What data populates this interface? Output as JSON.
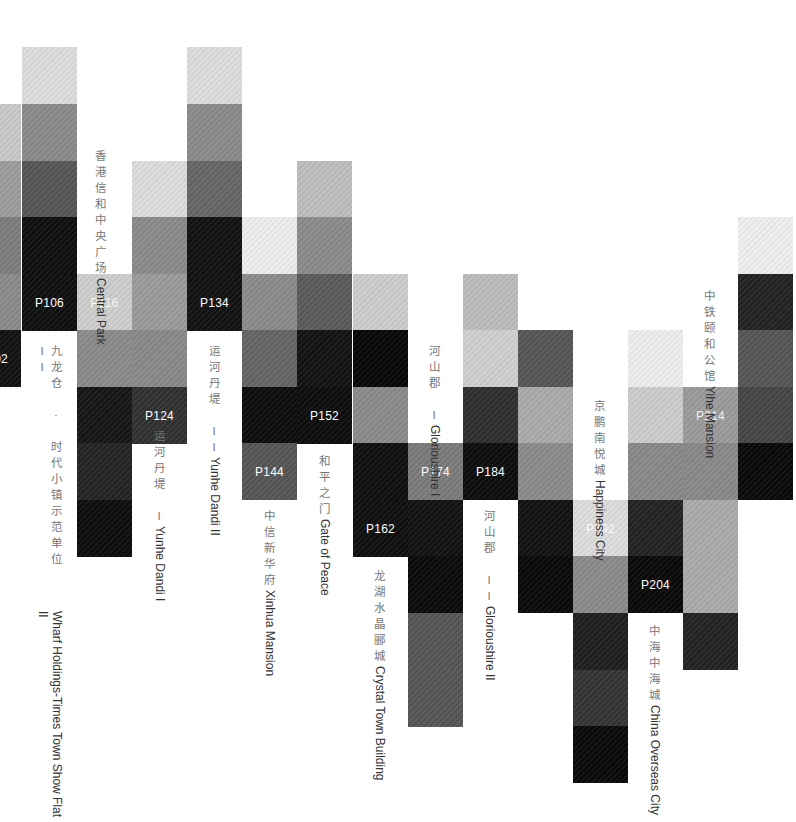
{
  "grid": {
    "col_x": [
      -34,
      22,
      77,
      132,
      187,
      242,
      297,
      353,
      408,
      463,
      518,
      573,
      628,
      683,
      738
    ],
    "row_y": [
      47,
      104,
      161,
      217,
      274,
      330,
      387,
      443,
      500,
      556,
      613,
      670,
      726
    ]
  },
  "cells": [
    {
      "c": 0,
      "r": 1,
      "color": "#c8c8c8"
    },
    {
      "c": 0,
      "r": 2,
      "color": "#9c9c9c"
    },
    {
      "c": 0,
      "r": 3,
      "color": "#7c7c7c"
    },
    {
      "c": 0,
      "r": 4,
      "color": "#8a8a8a"
    },
    {
      "c": 0,
      "r": 5,
      "color": "#111111",
      "page": "P102"
    },
    {
      "c": 1,
      "r": 0,
      "color": "#dcdcdc"
    },
    {
      "c": 1,
      "r": 1,
      "color": "#8a8a8a"
    },
    {
      "c": 1,
      "r": 2,
      "color": "#555555"
    },
    {
      "c": 1,
      "r": 3,
      "color": "#0e0e0e"
    },
    {
      "c": 1,
      "r": 4,
      "color": "#0e0e0e",
      "page": "P106"
    },
    {
      "c": 2,
      "r": 4,
      "color": "#cdcdcd",
      "page": "P116",
      "light": true
    },
    {
      "c": 2,
      "r": 5,
      "color": "#8a8a8a"
    },
    {
      "c": 2,
      "r": 6,
      "color": "#151515"
    },
    {
      "c": 2,
      "r": 7,
      "color": "#232323"
    },
    {
      "c": 2,
      "r": 8,
      "color": "#0c0c0c"
    },
    {
      "c": 3,
      "r": 2,
      "color": "#dcdcdc"
    },
    {
      "c": 3,
      "r": 3,
      "color": "#8a8a8a"
    },
    {
      "c": 3,
      "r": 4,
      "color": "#9a9a9a"
    },
    {
      "c": 3,
      "r": 5,
      "color": "#888888"
    },
    {
      "c": 3,
      "r": 6,
      "color": "#303030",
      "page": "P124"
    },
    {
      "c": 4,
      "r": 0,
      "color": "#dcdcdc"
    },
    {
      "c": 4,
      "r": 1,
      "color": "#8a8a8a"
    },
    {
      "c": 4,
      "r": 2,
      "color": "#666666"
    },
    {
      "c": 4,
      "r": 3,
      "color": "#111111"
    },
    {
      "c": 4,
      "r": 4,
      "color": "#111111",
      "page": "P134"
    },
    {
      "c": 5,
      "r": 3,
      "color": "#ececec"
    },
    {
      "c": 5,
      "r": 4,
      "color": "#8a8a8a"
    },
    {
      "c": 5,
      "r": 5,
      "color": "#646464"
    },
    {
      "c": 5,
      "r": 6,
      "color": "#0c0c0c"
    },
    {
      "c": 5,
      "r": 7,
      "color": "#555555",
      "page": "P144"
    },
    {
      "c": 6,
      "r": 2,
      "color": "#bdbdbd"
    },
    {
      "c": 6,
      "r": 3,
      "color": "#8a8a8a"
    },
    {
      "c": 6,
      "r": 4,
      "color": "#5a5a5a"
    },
    {
      "c": 6,
      "r": 5,
      "color": "#121212"
    },
    {
      "c": 6,
      "r": 6,
      "color": "#0c0c0c",
      "page": "P152"
    },
    {
      "c": 7,
      "r": 4,
      "color": "#cccccc"
    },
    {
      "c": 7,
      "r": 5,
      "color": "#060606"
    },
    {
      "c": 7,
      "r": 6,
      "color": "#8a8a8a"
    },
    {
      "c": 7,
      "r": 7,
      "color": "#0e0e0e"
    },
    {
      "c": 7,
      "r": 8,
      "color": "#0e0e0e",
      "page": "P162"
    },
    {
      "c": 8,
      "r": 7,
      "color": "#7a7a7a",
      "page": "P174"
    },
    {
      "c": 8,
      "r": 8,
      "color": "#111111"
    },
    {
      "c": 8,
      "r": 9,
      "color": "#0a0a0a"
    },
    {
      "c": 8,
      "r": 10,
      "color": "#555555"
    },
    {
      "c": 8,
      "r": 11,
      "color": "#555555"
    },
    {
      "c": 9,
      "r": 4,
      "color": "#bbbbbb"
    },
    {
      "c": 9,
      "r": 5,
      "color": "#cfcfcf"
    },
    {
      "c": 9,
      "r": 6,
      "color": "#2e2e2e"
    },
    {
      "c": 9,
      "r": 7,
      "color": "#0c0c0c",
      "page": "P184"
    },
    {
      "c": 10,
      "r": 5,
      "color": "#555555"
    },
    {
      "c": 10,
      "r": 6,
      "color": "#aaaaaa"
    },
    {
      "c": 10,
      "r": 7,
      "color": "#8a8a8a"
    },
    {
      "c": 10,
      "r": 8,
      "color": "#111111"
    },
    {
      "c": 10,
      "r": 9,
      "color": "#080808"
    },
    {
      "c": 11,
      "r": 8,
      "color": "#dcdcdc",
      "page": "P192",
      "light": true
    },
    {
      "c": 11,
      "r": 9,
      "color": "#8a8a8a"
    },
    {
      "c": 11,
      "r": 10,
      "color": "#1e1e1e"
    },
    {
      "c": 11,
      "r": 11,
      "color": "#333333"
    },
    {
      "c": 11,
      "r": 12,
      "color": "#080808"
    },
    {
      "c": 12,
      "r": 5,
      "color": "#ededed"
    },
    {
      "c": 12,
      "r": 6,
      "color": "#cccccc"
    },
    {
      "c": 12,
      "r": 7,
      "color": "#888888"
    },
    {
      "c": 12,
      "r": 8,
      "color": "#222222"
    },
    {
      "c": 12,
      "r": 9,
      "color": "#080808",
      "page": "P204"
    },
    {
      "c": 13,
      "r": 6,
      "color": "#9a9a9a",
      "page": "P214",
      "light": true
    },
    {
      "c": 13,
      "r": 7,
      "color": "#888888"
    },
    {
      "c": 13,
      "r": 8,
      "color": "#aaaaaa"
    },
    {
      "c": 13,
      "r": 9,
      "color": "#aaaaaa"
    },
    {
      "c": 13,
      "r": 10,
      "color": "#222222"
    },
    {
      "c": 14,
      "r": 3,
      "color": "#eeeeee"
    },
    {
      "c": 14,
      "r": 4,
      "color": "#222222"
    },
    {
      "c": 14,
      "r": 5,
      "color": "#555555"
    },
    {
      "c": 14,
      "r": 6,
      "color": "#454545"
    },
    {
      "c": 14,
      "r": 7,
      "color": "#080808"
    }
  ],
  "labels": [
    {
      "x": 86,
      "y": 150,
      "zh": "香港信和中央广场",
      "en": "Central Park"
    },
    {
      "x": 30,
      "y": 345,
      "zh": "九龙仓 · 时代小镇示范单位 II",
      "en": "Wharf Holdings-Times Town Show Flat II"
    },
    {
      "x": 200,
      "y": 345,
      "zh": "运河丹堤 II",
      "en": "Yunhe Dandi II"
    },
    {
      "x": 145,
      "y": 430,
      "zh": "运河丹堤 I",
      "en": "Yunhe Dandi I"
    },
    {
      "x": 255,
      "y": 510,
      "zh": "中信新华府",
      "en": "Xinhua Mansion"
    },
    {
      "x": 310,
      "y": 455,
      "zh": "和平之门",
      "en": "Gate of Peace"
    },
    {
      "x": 365,
      "y": 570,
      "zh": "龙湖水晶郦城",
      "en": "Crystal Town Building"
    },
    {
      "x": 420,
      "y": 345,
      "zh": "河山郡 I",
      "en": "Glorioushire I"
    },
    {
      "x": 475,
      "y": 510,
      "zh": "河山郡 II",
      "en": "Glorioushire II"
    },
    {
      "x": 585,
      "y": 400,
      "zh": "京鹏南悦城",
      "en": "Happiness City"
    },
    {
      "x": 640,
      "y": 625,
      "zh": "中海中海城",
      "en": "China Overseas City"
    },
    {
      "x": 695,
      "y": 290,
      "zh": "中铁颐和公馆",
      "en": "Yihe Mansion"
    }
  ]
}
